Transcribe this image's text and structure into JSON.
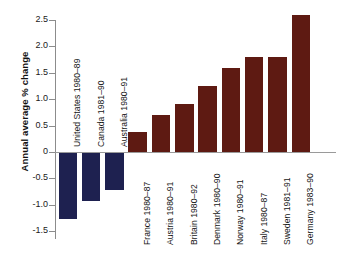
{
  "chart_data": {
    "type": "bar",
    "title": "",
    "subtitle": "",
    "xlabel": "",
    "ylabel": "Annual average % change",
    "ylim": [
      -1.5,
      2.5
    ],
    "ytick_labels": [
      "2.5",
      "2.0",
      "1.5",
      "1.0",
      "0.5",
      "0",
      "-0.5",
      "-1.0",
      "-1.5"
    ],
    "ytick_values": [
      2.5,
      2.0,
      1.5,
      1.0,
      0.5,
      0,
      -0.5,
      -1.0,
      -1.5
    ],
    "grid": false,
    "legend": "none",
    "categories": [
      "United States 1980–89",
      "Canada 1981–90",
      "Australia 1980–91",
      "France 1980–87",
      "Austria 1980–91",
      "Britain 1980–92",
      "Denmark 1980–90",
      "Norway 1980–91",
      "Italy 1980–87",
      "Sweden 1981–91",
      "Germany 1983–90"
    ],
    "values": [
      -1.25,
      -0.9,
      -0.7,
      0.38,
      0.7,
      0.9,
      1.25,
      1.6,
      1.8,
      1.8,
      2.6
    ],
    "bar_colors": [
      "#1e2150",
      "#1e2150",
      "#1e2150",
      "#5e1a12",
      "#5e1a12",
      "#5e1a12",
      "#5e1a12",
      "#5e1a12",
      "#5e1a12",
      "#5e1a12",
      "#5e1a12"
    ],
    "colors": {
      "negative": "#1e2150",
      "positive": "#5e1a12",
      "axis": "#8c8c8c",
      "zero_line": "#9a9a9a",
      "text": "#141414",
      "background": "#ffffff"
    }
  }
}
